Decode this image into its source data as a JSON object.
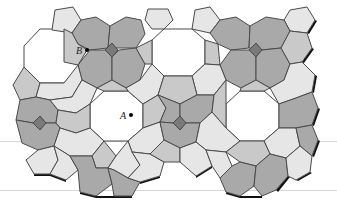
{
  "figure": {
    "width": 337,
    "height": 207,
    "colors": {
      "white_octagon": "#ffffff",
      "light_cell": "#e6e6e6",
      "mid_cell": "#c9c9c9",
      "dark_cell": "#a9a9a9",
      "square": "#7a7a7a",
      "stroke": "#4a4a4a",
      "shadow": "#111111",
      "rule": "#d7d7d7"
    },
    "rules_y": [
      141,
      190
    ],
    "points": [
      {
        "id": "B",
        "label": "B",
        "x": 87,
        "y": 50,
        "label_x": 76,
        "label_y": 54
      },
      {
        "id": "A",
        "label": "A",
        "x": 131,
        "y": 115,
        "label_x": 120,
        "label_y": 119
      }
    ],
    "tiles": [
      {
        "name": "octagon-left-top",
        "kind": "white_octagon",
        "pts": "40,29 64,29 79,46 79,67 64,83 40,83 24,67 24,46"
      },
      {
        "name": "octagon-center-top",
        "kind": "white_octagon",
        "pts": "164,29 192,29 205,40 205,64 192,76 164,76 152,64 152,40"
      },
      {
        "name": "octagon-center-left",
        "kind": "white_octagon",
        "pts": "104,91 128,91 143,104 143,128 128,141 104,141 90,128 90,104"
      },
      {
        "name": "octagon-center-right",
        "kind": "white_octagon",
        "pts": "240,91 264,91 279,104 279,128 264,141 240,141 226,128 226,104"
      },
      {
        "name": "pent-top-1",
        "kind": "light_cell",
        "pts": "55,10 73,7 81,20 72,33 52,30"
      },
      {
        "name": "pent-top-2",
        "kind": "light_cell",
        "pts": "148,9 168,9 173,20 164,29 152,29 145,20"
      },
      {
        "name": "pent-top-3",
        "kind": "light_cell",
        "pts": "195,10 210,7 220,20 210,33 192,29"
      },
      {
        "name": "pent-top-4",
        "kind": "light_cell",
        "pts": "290,10 307,7 315,20 307,33 290,31 284,20"
      },
      {
        "name": "hept-top-dark-1",
        "kind": "dark_cell",
        "pts": "81,20 96,17 110,26 108,48 90,50 78,44 72,33"
      },
      {
        "name": "hept-top-dark-2",
        "kind": "dark_cell",
        "pts": "110,26 126,17 141,20 145,34 136,48 118,48 108,48"
      },
      {
        "name": "hept-top-dark-3",
        "kind": "dark_cell",
        "pts": "220,20 236,17 250,26 249,48 231,50 218,44 210,33"
      },
      {
        "name": "hept-top-dark-4",
        "kind": "dark_cell",
        "pts": "250,26 266,17 284,20 290,31 281,48 262,50 249,48"
      },
      {
        "name": "square-left",
        "kind": "square",
        "pts": "112,43 118,50 112,57 105,50"
      },
      {
        "name": "square-right",
        "kind": "square",
        "pts": "256,43 262,50 256,57 249,50"
      },
      {
        "name": "square-bottom-left",
        "kind": "square",
        "pts": "40,116 46,123 40,130 33,123"
      },
      {
        "name": "square-bottom-center",
        "kind": "square",
        "pts": "180,116 186,123 180,130 173,123"
      },
      {
        "name": "hept-mid-dark-1",
        "kind": "dark_cell",
        "pts": "90,50 105,50 112,57 112,80 97,88 82,80 78,65"
      },
      {
        "name": "hept-mid-dark-2",
        "kind": "dark_cell",
        "pts": "112,57 119,50 136,48 145,64 140,80 126,88 112,80"
      },
      {
        "name": "hept-mid-dark-3",
        "kind": "dark_cell",
        "pts": "231,50 249,50 256,57 256,80 241,88 226,80 220,65"
      },
      {
        "name": "hept-mid-dark-4",
        "kind": "dark_cell",
        "pts": "256,57 262,50 281,48 290,64 284,80 270,88 256,80"
      },
      {
        "name": "pent-mid-1",
        "kind": "mid_cell",
        "pts": "64,29 72,33 78,44 87,50 78,65 64,62"
      },
      {
        "name": "pent-mid-2",
        "kind": "mid_cell",
        "pts": "136,48 152,40 152,64 145,64"
      },
      {
        "name": "pent-mid-3",
        "kind": "mid_cell",
        "pts": "205,40 218,44 220,65 205,64"
      },
      {
        "name": "pent-mid-4",
        "kind": "mid_cell",
        "pts": "290,31 307,33 312,48 302,62 290,64 281,48"
      },
      {
        "name": "pent-left-1",
        "kind": "mid_cell",
        "pts": "24,67 40,83 36,97 20,100 13,85"
      },
      {
        "name": "pent-light-2",
        "kind": "light_cell",
        "pts": "40,83 64,83 78,65 82,80 72,97 50,100 36,97"
      },
      {
        "name": "pent-light-3",
        "kind": "light_cell",
        "pts": "140,80 152,64 164,76 158,95 143,104 128,91 126,88"
      },
      {
        "name": "pent-light-4",
        "kind": "light_cell",
        "pts": "192,76 205,64 220,65 226,80 214,95 197,95"
      },
      {
        "name": "pent-mid-5",
        "kind": "mid_cell",
        "pts": "97,88 112,80 126,88 128,91 104,91"
      },
      {
        "name": "pent-mid-6",
        "kind": "mid_cell",
        "pts": "164,76 192,76 197,95 180,104 158,95"
      },
      {
        "name": "pent-mid-7",
        "kind": "mid_cell",
        "pts": "241,88 256,80 270,88 264,91 240,91"
      },
      {
        "name": "pent-light-8",
        "kind": "light_cell",
        "pts": "284,80 290,64 302,62 315,75 312,92 296,98 279,104 270,88"
      },
      {
        "name": "hept-left-dark-5",
        "kind": "dark_cell",
        "pts": "20,100 36,97 50,100 58,110 56,123 46,123 40,116 33,123 16,120"
      },
      {
        "name": "pent-light-9",
        "kind": "light_cell",
        "pts": "50,100 72,97 82,80 97,88 90,104 76,113 58,110"
      },
      {
        "name": "pent-mid-10",
        "kind": "mid_cell",
        "pts": "58,110 76,113 90,104 90,128 76,133 60,128 56,123"
      },
      {
        "name": "pent-mid-11",
        "kind": "mid_cell",
        "pts": "143,104 158,95 166,108 160,122 143,128"
      },
      {
        "name": "hept-dark-12",
        "kind": "dark_cell",
        "pts": "158,95 180,104 180,116 173,123 160,122 166,108"
      },
      {
        "name": "hept-dark-13",
        "kind": "dark_cell",
        "pts": "180,104 197,95 214,95 212,112 200,123 186,123 180,116"
      },
      {
        "name": "pent-mid-14",
        "kind": "mid_cell",
        "pts": "214,95 226,80 226,104 226,128 212,112"
      },
      {
        "name": "hept-dark-15",
        "kind": "dark_cell",
        "pts": "279,104 296,98 312,92 318,108 312,125 296,128 279,128"
      },
      {
        "name": "hept-dark-16",
        "kind": "dark_cell",
        "pts": "16,120 33,123 40,130 46,123 56,123 60,128 54,146 38,150 22,143"
      },
      {
        "name": "pent-light-17",
        "kind": "light_cell",
        "pts": "60,128 76,133 90,128 104,141 92,156 70,156 54,146"
      },
      {
        "name": "pent-light-18",
        "kind": "light_cell",
        "pts": "128,141 143,128 160,122 164,140 150,154 132,152"
      },
      {
        "name": "hept-dark-19",
        "kind": "dark_cell",
        "pts": "160,122 173,123 180,130 186,123 200,123 196,142 180,148 164,140"
      },
      {
        "name": "pent-light-20",
        "kind": "light_cell",
        "pts": "200,123 212,112 226,128 240,141 226,152 206,150 196,142"
      },
      {
        "name": "pent-light-21",
        "kind": "light_cell",
        "pts": "264,141 279,128 296,128 300,146 286,158 270,154"
      },
      {
        "name": "hept-dark-22",
        "kind": "dark_cell",
        "pts": "296,128 312,125 318,140 312,156 300,146"
      },
      {
        "name": "pent-light-bl-1",
        "kind": "light_cell",
        "pts": "38,150 54,146 58,160 50,174 34,174 26,160"
      },
      {
        "name": "pent-light-bl-2",
        "kind": "light_cell",
        "pts": "54,146 70,156 78,170 66,180 50,174 58,160"
      },
      {
        "name": "pent-mid-bl-3",
        "kind": "mid_cell",
        "pts": "92,156 104,141 116,156 108,168 96,168"
      },
      {
        "name": "pent-light-bl-4",
        "kind": "light_cell",
        "pts": "116,156 128,141 132,152 140,165 128,178 114,170 108,168"
      },
      {
        "name": "hept-dark-bl-5",
        "kind": "dark_cell",
        "pts": "70,156 92,156 96,168 108,168 112,184 96,196 80,192 78,170"
      },
      {
        "name": "hept-dark-bl-6",
        "kind": "dark_cell",
        "pts": "108,168 114,170 128,178 140,182 132,196 114,196 112,184"
      },
      {
        "name": "pent-light-bc-7",
        "kind": "light_cell",
        "pts": "132,152 150,154 164,162 160,176 140,182 128,178 140,165"
      },
      {
        "name": "pent-mid-bc-8",
        "kind": "mid_cell",
        "pts": "150,154 164,140 180,148 180,162 164,162"
      },
      {
        "name": "pent-light-bc-9",
        "kind": "light_cell",
        "pts": "180,148 196,142 206,150 212,166 196,176 180,162"
      },
      {
        "name": "pent-light-bc-10",
        "kind": "light_cell",
        "pts": "206,150 226,152 232,166 220,178 212,166"
      },
      {
        "name": "pent-mid-br-11",
        "kind": "mid_cell",
        "pts": "240,141 264,141 270,154 256,166 240,162 226,152"
      },
      {
        "name": "hept-dark-br-12",
        "kind": "dark_cell",
        "pts": "220,178 232,166 240,162 256,166 254,186 240,196 226,192"
      },
      {
        "name": "hept-dark-br-13",
        "kind": "dark_cell",
        "pts": "256,166 270,154 286,158 288,176 276,190 262,196 254,186"
      },
      {
        "name": "pent-light-br-14",
        "kind": "light_cell",
        "pts": "286,158 300,146 312,156 310,172 296,180 288,176"
      }
    ],
    "shadow_edges": [
      {
        "name": "shadow-top-1",
        "pts": "81,20 83,21 74,34 72,33"
      },
      {
        "name": "shadow-top-3",
        "pts": "220,20 222,21 212,34 210,33"
      },
      {
        "name": "shadow-right-1",
        "pts": "315,20 317,21 309,34 307,33"
      },
      {
        "name": "shadow-right-2",
        "pts": "312,48 314,49 304,63 302,62"
      },
      {
        "name": "shadow-right-3",
        "pts": "315,75 317,76 314,93 312,92"
      },
      {
        "name": "shadow-right-4",
        "pts": "318,108 320,109 314,126 312,125"
      },
      {
        "name": "shadow-right-5",
        "pts": "318,140 320,141 314,157 312,156"
      },
      {
        "name": "shadow-right-6",
        "pts": "310,172 312,173 298,181 296,180"
      },
      {
        "name": "shadow-bottom-1",
        "pts": "34,174 50,174 50,176 34,176"
      },
      {
        "name": "shadow-bottom-2",
        "pts": "50,174 66,180 66,182 50,176"
      },
      {
        "name": "shadow-bottom-3",
        "pts": "80,192 96,196 96,198 80,194"
      },
      {
        "name": "shadow-bottom-4",
        "pts": "96,196 114,196 114,198 96,198"
      },
      {
        "name": "shadow-bottom-5",
        "pts": "114,196 132,196 132,198 114,198"
      },
      {
        "name": "shadow-bottom-6",
        "pts": "160,176 140,182 140,184 160,178"
      },
      {
        "name": "shadow-bottom-7",
        "pts": "196,176 212,166 212,168 196,178"
      },
      {
        "name": "shadow-bottom-8",
        "pts": "226,192 240,196 240,198 226,194"
      },
      {
        "name": "shadow-bottom-9",
        "pts": "240,196 262,196 262,198 240,198"
      },
      {
        "name": "shadow-bottom-10",
        "pts": "276,190 288,176 290,177 278,192"
      }
    ]
  }
}
